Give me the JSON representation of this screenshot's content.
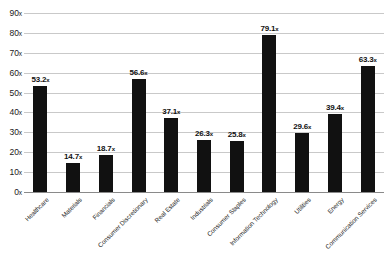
{
  "chart_data": {
    "type": "bar",
    "title": "",
    "subtitle": "",
    "xlabel": "",
    "ylabel": "",
    "ylim": [
      0,
      90
    ],
    "grid": true,
    "legend": "none",
    "orientation": "vertical",
    "bar_color": "#111111",
    "grid_color": "#c9c9c9",
    "axis_color": "#8a8a8a",
    "value_suffix": "x",
    "label_rotation": -45,
    "ytick_values": [
      0,
      10,
      20,
      30,
      40,
      50,
      60,
      70,
      80,
      90
    ],
    "ytick_labels": [
      "0x",
      "10x",
      "20x",
      "30x",
      "40x",
      "50x",
      "60x",
      "70x",
      "80x",
      "90x"
    ],
    "categories": [
      "Healthcare",
      "Materials",
      "Financials",
      "Consumer Discretionary",
      "Real Estate",
      "Industrials",
      "Consumer Staples",
      "Information Technology",
      "Utilities",
      "Energy",
      "Communication Services"
    ],
    "values": [
      53.2,
      14.7,
      18.7,
      56.6,
      37.1,
      26.3,
      25.8,
      79.1,
      29.6,
      39.4,
      63.3
    ],
    "value_labels": [
      "53.2x",
      "14.7x",
      "18.7x",
      "56.6x",
      "37.1x",
      "26.3x",
      "25.8x",
      "79.1x",
      "29.6x",
      "39.4x",
      "63.3x"
    ]
  }
}
